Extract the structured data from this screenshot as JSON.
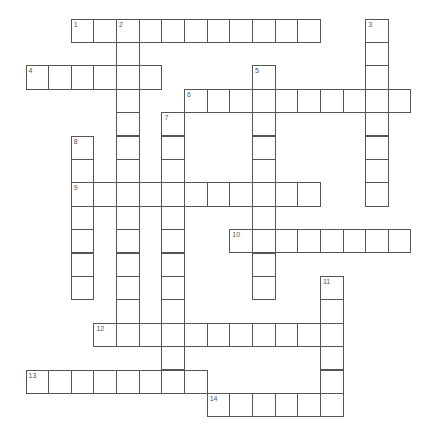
{
  "puzzle": {
    "type": "crossword",
    "entries": [
      {
        "number": "1",
        "direction": "across",
        "row": 0,
        "col": 2,
        "length": 11
      },
      {
        "number": "2",
        "direction": "down",
        "row": 0,
        "col": 4,
        "length": 14
      },
      {
        "number": "3",
        "direction": "down",
        "row": 0,
        "col": 15,
        "length": 8
      },
      {
        "number": "4",
        "direction": "across",
        "row": 2,
        "col": 0,
        "length": 6
      },
      {
        "number": "5",
        "direction": "down",
        "row": 2,
        "col": 10,
        "length": 10
      },
      {
        "number": "6",
        "direction": "across",
        "row": 3,
        "col": 7,
        "length": 10
      },
      {
        "number": "7",
        "direction": "down",
        "row": 4,
        "col": 6,
        "length": 12
      },
      {
        "number": "8",
        "direction": "down",
        "row": 5,
        "col": 2,
        "length": 7
      },
      {
        "number": "9",
        "direction": "across",
        "row": 7,
        "col": 2,
        "length": 11
      },
      {
        "number": "10",
        "direction": "across",
        "row": 9,
        "col": 9,
        "length": 8
      },
      {
        "number": "11",
        "direction": "down",
        "row": 11,
        "col": 13,
        "length": 6
      },
      {
        "number": "12",
        "direction": "across",
        "row": 13,
        "col": 3,
        "length": 11
      },
      {
        "number": "13",
        "direction": "across",
        "row": 15,
        "col": 0,
        "length": 8
      },
      {
        "number": "14",
        "direction": "across",
        "row": 16,
        "col": 8,
        "length": 6
      }
    ]
  }
}
